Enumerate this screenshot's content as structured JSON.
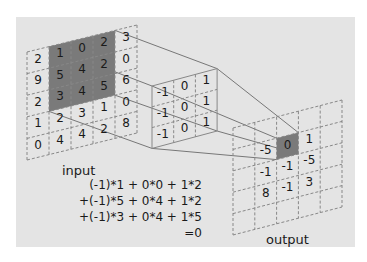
{
  "colors": {
    "background": "#e4e4e4",
    "highlight": "#7a7a7a",
    "grid_line": "#888888",
    "text": "#1a1a1a"
  },
  "input": {
    "label": "input",
    "rows": [
      [
        "2",
        "1",
        "0",
        "2",
        "3"
      ],
      [
        "9",
        "5",
        "4",
        "2",
        "0"
      ],
      [
        "2",
        "3",
        "4",
        "5",
        "6"
      ],
      [
        "1",
        "2",
        "3",
        "1",
        "0"
      ],
      [
        "0",
        "4",
        "4",
        "2",
        "8"
      ]
    ],
    "highlight": {
      "rows": [
        0,
        2
      ],
      "cols": [
        1,
        3
      ]
    }
  },
  "kernel": {
    "rows": [
      [
        "-1",
        "0",
        "1"
      ],
      [
        "-1",
        "0",
        "1"
      ],
      [
        "-1",
        "0",
        "1"
      ]
    ]
  },
  "output": {
    "label": "output",
    "rows": [
      [
        "",
        "",
        "",
        "",
        ""
      ],
      [
        "",
        "-5",
        "0",
        "1",
        ""
      ],
      [
        "",
        "-1",
        "-1",
        "-5",
        ""
      ],
      [
        "",
        "8",
        "-1",
        "3",
        ""
      ],
      [
        "",
        "",
        "",
        "",
        ""
      ]
    ],
    "highlight": {
      "row": 1,
      "col": 2
    }
  },
  "equation": {
    "lines": [
      "(-1)*1 +  0*0 + 1*2",
      "+(-1)*5 +  0*4 + 1*2",
      "+(-1)*3 +  0*4 + 1*5",
      "=0"
    ]
  }
}
